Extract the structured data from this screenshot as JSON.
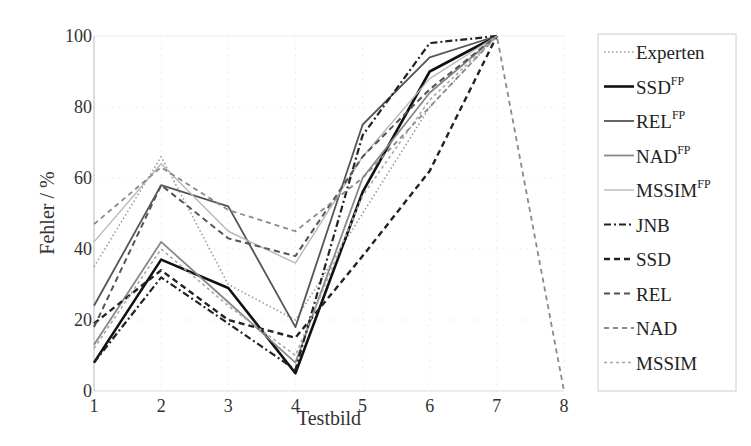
{
  "chart_data": {
    "type": "line",
    "title": "",
    "xlabel": "Testbild",
    "ylabel": "Fehler / %",
    "x": [
      1,
      2,
      3,
      4,
      5,
      6,
      7,
      8
    ],
    "xlim": [
      1,
      8
    ],
    "ylim": [
      0,
      100
    ],
    "xticks": [
      "1",
      "2",
      "3",
      "4",
      "5",
      "6",
      "7",
      "8"
    ],
    "yticks": [
      "0",
      "20",
      "40",
      "60",
      "80",
      "100"
    ],
    "ytick_values": [
      0,
      20,
      40,
      60,
      80,
      100
    ],
    "grid": true,
    "legend_position": "right-outside",
    "series": [
      {
        "name": "Experten",
        "sup": "",
        "style": "dotted",
        "color": "#9a9a9a",
        "values": [
          35,
          66,
          30,
          20,
          50,
          80,
          100,
          null
        ]
      },
      {
        "name": "SSD",
        "sup": "FP",
        "style": "solid-thick",
        "color": "#111111",
        "values": [
          8,
          37,
          29,
          5,
          56,
          90,
          100,
          null
        ]
      },
      {
        "name": "REL",
        "sup": "FP",
        "style": "solid",
        "color": "#555555",
        "values": [
          24,
          58,
          52,
          18,
          75,
          94,
          100,
          null
        ]
      },
      {
        "name": "NAD",
        "sup": "FP",
        "style": "solid",
        "color": "#888888",
        "values": [
          13,
          42,
          25,
          8,
          60,
          84,
          100,
          null
        ]
      },
      {
        "name": "MSSIM",
        "sup": "FP",
        "style": "solid-light",
        "color": "#b8b8b8",
        "values": [
          42,
          64,
          45,
          36,
          66,
          88,
          100,
          null
        ]
      },
      {
        "name": "JNB",
        "sup": "",
        "style": "dashdot",
        "color": "#222222",
        "values": [
          8,
          32,
          19,
          6,
          72,
          98,
          100,
          null
        ]
      },
      {
        "name": "SSD",
        "sup": "",
        "style": "dashed-thick",
        "color": "#222222",
        "values": [
          19,
          34,
          20,
          15,
          38,
          62,
          100,
          null
        ]
      },
      {
        "name": "REL",
        "sup": "",
        "style": "dashed",
        "color": "#555555",
        "values": [
          18,
          58,
          43,
          38,
          66,
          85,
          100,
          null
        ]
      },
      {
        "name": "NAD",
        "sup": "",
        "style": "dashed-light",
        "color": "#8a8a8a",
        "values": [
          47,
          63,
          51,
          45,
          60,
          80,
          100,
          0
        ]
      },
      {
        "name": "MSSIM",
        "sup": "",
        "style": "dotted-light",
        "color": "#a8a8a8",
        "values": [
          12,
          40,
          24,
          10,
          55,
          82,
          100,
          null
        ]
      }
    ]
  }
}
